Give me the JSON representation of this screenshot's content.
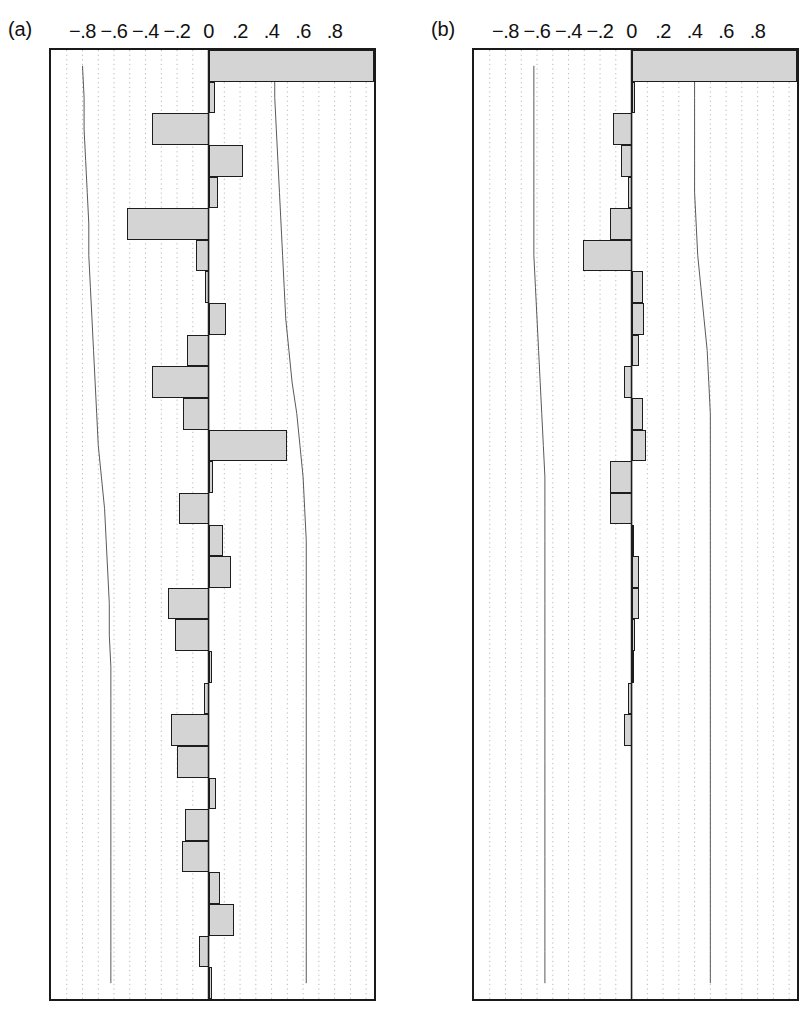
{
  "figure": {
    "type": "two-panel-horizontal-bar",
    "background": "#ffffff",
    "bar_fill": "#d4d4d4",
    "bar_stroke": "#1d1d1d",
    "grid_color": "#b8b8b8",
    "envelope_color": "#5a5a5a"
  },
  "panels": [
    {
      "label": "(a)",
      "axis": {
        "ticks": [
          "-.8",
          "-.6",
          "-.4",
          "-.2",
          "0",
          ".2",
          ".4",
          ".6",
          ".8"
        ],
        "tick_values": [
          -0.8,
          -0.6,
          -0.4,
          -0.2,
          0,
          0.2,
          0.4,
          0.6,
          0.8
        ],
        "xlim": [
          -1.0,
          1.05
        ],
        "grid": "dotted vertical at 0.1 intervals",
        "zero_value": 0
      }
    },
    {
      "label": "(b)",
      "axis": {
        "ticks": [
          "-.8",
          "-.6",
          "-.4",
          "-.2",
          "0",
          ".2",
          ".4",
          ".6",
          ".8"
        ],
        "tick_values": [
          -0.8,
          -0.6,
          -0.4,
          -0.2,
          0,
          0.2,
          0.4,
          0.6,
          0.8
        ],
        "xlim": [
          -1.0,
          1.05
        ],
        "grid": "dotted vertical at 0.1 intervals",
        "zero_value": 0
      }
    }
  ],
  "chart_data": [
    {
      "type": "bar",
      "orientation": "horizontal",
      "title": "(a)",
      "xlabel": "",
      "ylabel": "",
      "xlim": [
        -1.0,
        1.05
      ],
      "ylim": [
        0,
        30
      ],
      "grid": true,
      "legend": "none",
      "categories": [
        "1",
        "2",
        "3",
        "4",
        "5",
        "6",
        "7",
        "8",
        "9",
        "10",
        "11",
        "12",
        "13",
        "14",
        "15",
        "16",
        "17",
        "18",
        "19",
        "20",
        "21",
        "22",
        "23",
        "24",
        "25",
        "26",
        "27",
        "28",
        "29",
        "30"
      ],
      "values": [
        1.05,
        0.04,
        -0.36,
        0.22,
        0.06,
        -0.52,
        -0.08,
        -0.02,
        0.11,
        -0.14,
        -0.36,
        -0.16,
        0.5,
        0.03,
        -0.19,
        0.09,
        0.14,
        -0.26,
        -0.21,
        0.02,
        -0.03,
        -0.24,
        -0.2,
        0.05,
        -0.15,
        -0.17,
        0.07,
        0.16,
        -0.06,
        0.02
      ],
      "envelopes": {
        "lower": [
          -0.8,
          -0.79,
          -0.79,
          -0.78,
          -0.77,
          -0.76,
          -0.76,
          -0.75,
          -0.74,
          -0.73,
          -0.72,
          -0.71,
          -0.7,
          -0.68,
          -0.66,
          -0.65,
          -0.64,
          -0.63,
          -0.63,
          -0.62,
          -0.62,
          -0.62,
          -0.62,
          -0.62,
          -0.62,
          -0.62,
          -0.62,
          -0.62,
          -0.62,
          -0.62
        ],
        "upper": [
          0.42,
          0.42,
          0.43,
          0.44,
          0.45,
          0.46,
          0.47,
          0.48,
          0.49,
          0.51,
          0.53,
          0.56,
          0.58,
          0.6,
          0.61,
          0.62,
          0.62,
          0.62,
          0.62,
          0.62,
          0.62,
          0.62,
          0.62,
          0.62,
          0.62,
          0.62,
          0.62,
          0.62,
          0.62,
          0.62
        ]
      }
    },
    {
      "type": "bar",
      "orientation": "horizontal",
      "title": "(b)",
      "xlabel": "",
      "ylabel": "",
      "xlim": [
        -1.0,
        1.05
      ],
      "ylim": [
        0,
        30
      ],
      "grid": true,
      "legend": "none",
      "categories": [
        "1",
        "2",
        "3",
        "4",
        "5",
        "6",
        "7",
        "8",
        "9",
        "10",
        "11",
        "12",
        "13",
        "14",
        "15",
        "16",
        "17",
        "18",
        "19",
        "20",
        "21",
        "22",
        "23",
        "24",
        "25",
        "26",
        "27",
        "28",
        "29",
        "30"
      ],
      "values": [
        1.05,
        0.02,
        -0.12,
        -0.07,
        -0.02,
        -0.14,
        -0.31,
        0.07,
        0.08,
        0.05,
        -0.05,
        0.07,
        0.09,
        -0.14,
        -0.14,
        0.01,
        0.05,
        0.05,
        0.02,
        0.01,
        -0.02,
        -0.05,
        0.0,
        0.0,
        0.0,
        0.0,
        0.0,
        0.0,
        0.0,
        0.0
      ],
      "envelopes": {
        "lower": [
          -0.62,
          -0.62,
          -0.62,
          -0.62,
          -0.62,
          -0.62,
          -0.62,
          -0.61,
          -0.6,
          -0.59,
          -0.58,
          -0.57,
          -0.56,
          -0.55,
          -0.55,
          -0.55,
          -0.55,
          -0.55,
          -0.55,
          -0.55,
          -0.55,
          -0.55,
          -0.55,
          -0.55,
          -0.55,
          -0.55,
          -0.55,
          -0.55,
          -0.55,
          -0.55
        ],
        "upper": [
          0.4,
          0.4,
          0.4,
          0.4,
          0.4,
          0.41,
          0.42,
          0.44,
          0.46,
          0.48,
          0.49,
          0.5,
          0.5,
          0.5,
          0.5,
          0.5,
          0.5,
          0.5,
          0.5,
          0.5,
          0.5,
          0.5,
          0.5,
          0.5,
          0.5,
          0.5,
          0.5,
          0.5,
          0.5,
          0.5
        ]
      }
    }
  ]
}
